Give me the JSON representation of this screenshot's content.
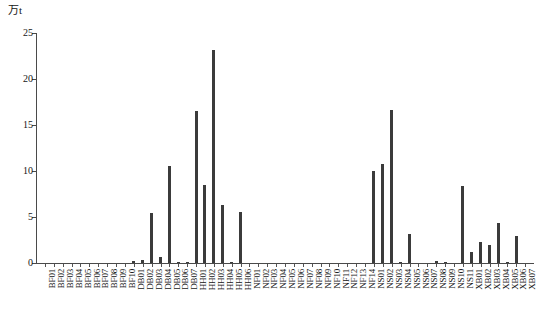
{
  "chart_data": {
    "type": "bar",
    "title": "",
    "subtitle": "",
    "xlabel": "",
    "ylabel": "万t",
    "ylim": [
      0,
      25
    ],
    "yticks": [
      0,
      5,
      10,
      15,
      20,
      25
    ],
    "ytick_labels": [
      "0",
      "5",
      "10",
      "15",
      "20",
      "25"
    ],
    "grid": false,
    "legend": null,
    "bar_color": "#3b3b3b",
    "axis_color": "#4a4a4a",
    "categories": [
      "BF01",
      "BF02",
      "BF03",
      "BF04",
      "BF05",
      "BF06",
      "BF07",
      "BF08",
      "BF09",
      "BF10",
      "DB01",
      "DB02",
      "DB03",
      "DB04",
      "DB05",
      "DB06",
      "DB07",
      "HH01",
      "HH02",
      "HH03",
      "HH04",
      "HH05",
      "HH06",
      "NF01",
      "NF02",
      "NF03",
      "NF04",
      "NF05",
      "NF06",
      "NF07",
      "NF08",
      "NF09",
      "NF10",
      "NF11",
      "NF12",
      "NF13",
      "NF14",
      "NS01",
      "NS02",
      "NS03",
      "NS04",
      "NS05",
      "NS06",
      "NS07",
      "NS08",
      "NS09",
      "NS10",
      "NS11",
      "XB01",
      "XB02",
      "XB03",
      "XB04",
      "XB05",
      "XB06",
      "XB07"
    ],
    "values": [
      0.0,
      0.0,
      0.0,
      0.0,
      0.0,
      0.0,
      0.0,
      0.0,
      0.0,
      0.0,
      0.25,
      0.35,
      5.4,
      0.6,
      10.5,
      0.1,
      0.05,
      16.5,
      8.5,
      23.1,
      6.3,
      0.15,
      5.5,
      0.0,
      0.0,
      0.0,
      0.0,
      0.0,
      0.0,
      0.0,
      0.0,
      0.0,
      0.0,
      0.0,
      0.0,
      0.0,
      0.0,
      10.0,
      10.8,
      16.6,
      0.1,
      3.1,
      0.0,
      0.0,
      0.2,
      0.1,
      0.0,
      8.4,
      1.2,
      2.3,
      2.0,
      4.4,
      0.15,
      2.9,
      0.0
    ]
  }
}
